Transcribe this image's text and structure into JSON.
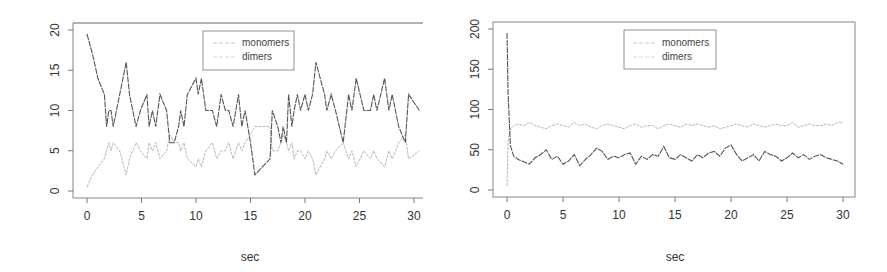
{
  "chart_data": [
    {
      "type": "line",
      "title": "",
      "xlabel": "sec",
      "ylabel": "",
      "xlim": [
        0,
        31
      ],
      "ylim": [
        0,
        20
      ],
      "x_ticks": [
        "0",
        "5",
        "10",
        "15",
        "20",
        "25",
        "30"
      ],
      "y_ticks": [
        "0",
        "5",
        "10",
        "15",
        "20"
      ],
      "grid": false,
      "legend_position": "top-center",
      "legend": [
        "monomers",
        "dimers"
      ],
      "x": [
        0,
        0.5,
        1,
        1.6,
        1.8,
        2,
        2.2,
        2.4,
        3,
        3.6,
        3.9,
        4.5,
        4.9,
        5.5,
        5.7,
        6,
        6.3,
        6.7,
        7.3,
        7.6,
        8,
        8.4,
        8.6,
        8.9,
        9.2,
        10,
        10.2,
        10.5,
        10.9,
        11.5,
        11.9,
        12.3,
        12.7,
        13,
        13.4,
        13.9,
        14.2,
        14.5,
        15,
        15.4,
        16.8,
        17,
        17.5,
        17.8,
        18,
        18.3,
        18.5,
        18.8,
        19,
        19.3,
        19.6,
        20,
        20.3,
        20.7,
        21,
        21.8,
        22,
        22.4,
        22.8,
        23.5,
        24,
        24.3,
        24.7,
        25.4,
        26,
        26.3,
        26.6,
        27.3,
        27.7,
        28,
        28.6,
        29.2,
        29.5,
        30.5
      ],
      "series": [
        {
          "name": "monomers",
          "color": "#b8b8b8",
          "values": [
            0.5,
            2,
            3,
            4,
            5,
            6,
            5,
            6,
            5,
            2,
            4,
            6,
            5,
            4,
            6,
            5,
            6,
            4,
            5,
            7,
            6,
            6,
            5,
            6,
            4,
            3,
            4,
            3,
            5,
            6,
            4,
            5,
            5,
            6,
            4,
            6,
            5,
            6,
            7,
            8,
            8,
            5,
            5,
            6,
            7,
            6,
            5,
            6,
            4,
            5,
            5,
            4,
            5,
            4,
            2,
            4,
            5,
            4,
            5,
            6,
            4,
            5,
            3,
            5,
            4,
            5,
            4,
            3,
            5,
            4,
            6,
            7,
            4,
            5
          ]
        },
        {
          "name": "dimers",
          "color": "#555555",
          "values": [
            19.5,
            17,
            14,
            12,
            8,
            10,
            10,
            8,
            12,
            16,
            12,
            8,
            10,
            12,
            8,
            10,
            8,
            12,
            10,
            6,
            6,
            8,
            10,
            8,
            12,
            14,
            12,
            14,
            10,
            10,
            8,
            12,
            10,
            10,
            8,
            12,
            8,
            10,
            6,
            2,
            4,
            10,
            8,
            6,
            8,
            6,
            12,
            8,
            10,
            12,
            10,
            12,
            10,
            12,
            16,
            12,
            10,
            12,
            10,
            6,
            12,
            10,
            14,
            10,
            10,
            12,
            10,
            14,
            10,
            12,
            8,
            6,
            12,
            10
          ]
        }
      ]
    },
    {
      "type": "line",
      "title": "",
      "xlabel": "sec",
      "ylabel": "",
      "xlim": [
        0,
        31
      ],
      "ylim": [
        0,
        200
      ],
      "x_ticks": [
        "0",
        "5",
        "10",
        "15",
        "20",
        "25",
        "30"
      ],
      "y_ticks": [
        "0",
        "50",
        "100",
        "150",
        "200"
      ],
      "grid": false,
      "legend_position": "top-center",
      "legend": [
        "monomers",
        "dimers"
      ],
      "x": [
        0,
        0.1,
        0.3,
        0.6,
        1,
        1.5,
        2,
        2.5,
        3,
        3.5,
        4,
        4.5,
        5,
        5.5,
        6,
        6.5,
        7,
        7.5,
        8,
        8.5,
        9,
        9.5,
        10,
        10.5,
        11,
        11.5,
        12,
        12.5,
        13,
        13.5,
        14,
        14.5,
        15,
        15.5,
        16,
        16.5,
        17,
        17.5,
        18,
        18.5,
        19,
        19.5,
        20,
        20.5,
        21,
        21.5,
        22,
        22.5,
        23,
        23.5,
        24,
        24.5,
        25,
        25.5,
        26,
        26.5,
        27,
        27.5,
        28,
        28.5,
        29,
        29.5,
        30
      ],
      "series": [
        {
          "name": "monomers",
          "color": "#b8b8b8",
          "values": [
            5,
            60,
            76,
            80,
            82,
            80,
            84,
            80,
            78,
            76,
            80,
            82,
            80,
            78,
            84,
            80,
            82,
            78,
            76,
            80,
            82,
            80,
            78,
            76,
            80,
            82,
            78,
            80,
            80,
            76,
            80,
            82,
            80,
            78,
            82,
            80,
            82,
            80,
            78,
            80,
            76,
            78,
            80,
            82,
            80,
            78,
            82,
            80,
            78,
            80,
            82,
            80,
            80,
            84,
            78,
            80,
            82,
            80,
            80,
            82,
            80,
            84,
            84
          ]
        },
        {
          "name": "dimers",
          "color": "#555555",
          "values": [
            195,
            120,
            55,
            42,
            38,
            35,
            32,
            40,
            44,
            50,
            38,
            42,
            32,
            36,
            44,
            30,
            38,
            44,
            52,
            48,
            38,
            42,
            40,
            44,
            46,
            32,
            42,
            38,
            44,
            42,
            54,
            40,
            38,
            44,
            40,
            36,
            44,
            40,
            46,
            48,
            42,
            52,
            56,
            44,
            36,
            40,
            44,
            36,
            48,
            44,
            42,
            36,
            40,
            46,
            40,
            44,
            38,
            42,
            44,
            40,
            38,
            36,
            32
          ]
        }
      ]
    }
  ],
  "left_panel": {
    "x_ticks": [
      "0",
      "5",
      "10",
      "15",
      "20",
      "25",
      "30"
    ],
    "y_ticks": [
      "0",
      "5",
      "10",
      "15",
      "20"
    ],
    "xlabel": "sec",
    "legend": {
      "items": [
        {
          "label": "monomers"
        },
        {
          "label": "dimers"
        }
      ]
    }
  },
  "right_panel": {
    "x_ticks": [
      "0",
      "5",
      "10",
      "15",
      "20",
      "25",
      "30"
    ],
    "y_ticks": [
      "0",
      "50",
      "100",
      "150",
      "200"
    ],
    "xlabel": "sec",
    "legend": {
      "items": [
        {
          "label": "monomers"
        },
        {
          "label": "dimers"
        }
      ]
    }
  }
}
